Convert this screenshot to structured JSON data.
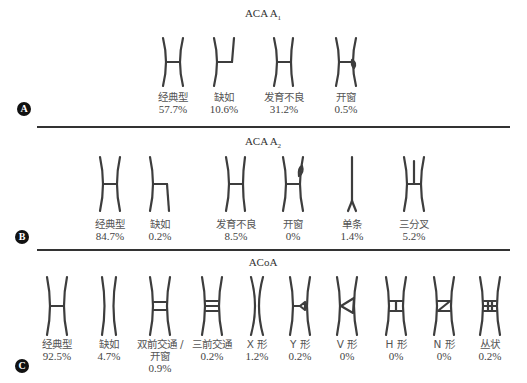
{
  "panels": [
    {
      "badge": "A",
      "title_main": "ACA A",
      "title_sub": "1",
      "items": [
        {
          "shape": "classic",
          "label": "经典型",
          "pct": "57.7%"
        },
        {
          "shape": "missing-half",
          "label": "缺如",
          "pct": "10.6%"
        },
        {
          "shape": "hypoplastic",
          "label": "发育不良",
          "pct": "31.2%"
        },
        {
          "shape": "fenestration",
          "label": "开窗",
          "pct": "0.5%"
        }
      ]
    },
    {
      "badge": "B",
      "title_main": "ACA A",
      "title_sub": "2",
      "items": [
        {
          "shape": "classic",
          "label": "经典型",
          "pct": "84.7%"
        },
        {
          "shape": "missing-a2",
          "label": "缺如",
          "pct": "0.2%"
        },
        {
          "shape": "hypoplastic",
          "label": "发育不良",
          "pct": "8.5%"
        },
        {
          "shape": "fenestration-top",
          "label": "开窗",
          "pct": "0%"
        },
        {
          "shape": "single",
          "label": "单条",
          "pct": "1.4%"
        },
        {
          "shape": "trifurcation",
          "label": "三分叉",
          "pct": "5.2%"
        }
      ]
    },
    {
      "badge": "C",
      "title_main": "ACoA",
      "title_sub": "",
      "items": [
        {
          "shape": "classic",
          "label": "经典型",
          "pct": "92.5%"
        },
        {
          "shape": "absent",
          "label": "缺如",
          "pct": "4.7%"
        },
        {
          "shape": "double",
          "label": "双前交通 /",
          "label2": "开窗",
          "pct": "0.9%"
        },
        {
          "shape": "triple",
          "label": "三前交通",
          "pct": "0.2%"
        },
        {
          "shape": "x",
          "label": "X 形",
          "pct": "1.2%"
        },
        {
          "shape": "y",
          "label": "Y 形",
          "pct": "0.2%"
        },
        {
          "shape": "v",
          "label": "V 形",
          "pct": "0%"
        },
        {
          "shape": "h",
          "label": "H 形",
          "pct": "0%"
        },
        {
          "shape": "n",
          "label": "N 形",
          "pct": "0%"
        },
        {
          "shape": "plexus",
          "label": "丛状",
          "pct": "0.2%"
        }
      ]
    }
  ],
  "colors": {
    "vessel": "#3d3d3d",
    "badge": "#111111",
    "rule": "#333333"
  }
}
